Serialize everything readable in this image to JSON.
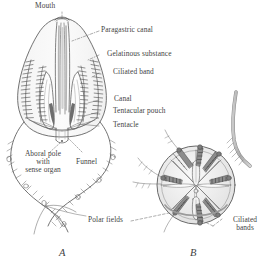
{
  "figure": {
    "caption_a": "A",
    "caption_b": "B",
    "background_color": "#ffffff",
    "ink_color": "#5a5a5a",
    "text_color": "#3f3f3f"
  },
  "labels": {
    "mouth": "Mouth",
    "paragastric_canal": "Paragastric canal",
    "gelatinous_substance": "Gelatinous substance",
    "ciliated_band": "Ciliated band",
    "canal": "Canal",
    "tentacular_pouch": "Tentacular pouch",
    "tentacle": "Tentacle",
    "aboral_pole_line1": "Aboral pole",
    "aboral_pole_line2": "with",
    "aboral_pole_line3": "sense organ",
    "funnel": "Funnel",
    "polar_fields": "Polar fields",
    "ciliated_bands_line1": "Ciliated",
    "ciliated_bands_line2": "bands"
  },
  "figure_a": {
    "name": "lateral-view-ctenophore",
    "comb_rows": 4,
    "tentacles": 2
  },
  "figure_b": {
    "name": "aboral-view-ctenophore",
    "comb_rows": 8
  }
}
